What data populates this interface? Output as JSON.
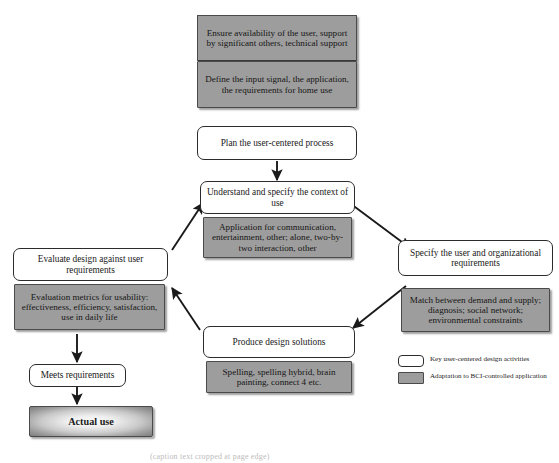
{
  "diagram": {
    "colors": {
      "white_box_fill": "#ffffff",
      "gray_box_fill": "#9d9d9d",
      "outline": "#2b2b2b",
      "arrow": "#1a1a1a",
      "actual_use_center": "#fbfbfb",
      "actual_use_edge": "#7d7d7d"
    },
    "top_stack": [
      {
        "id": "ensure-availability",
        "type": "adaptation",
        "text": "Ensure availability of the user, support by significant others, technical support"
      },
      {
        "id": "define-input-signal",
        "type": "adaptation",
        "text": "Define the input signal, the application, the requirements for home use"
      },
      {
        "id": "plan-process",
        "type": "key-activity",
        "text": "Plan the user-centered process"
      }
    ],
    "cycle": [
      {
        "id": "understand-context",
        "type": "key-activity",
        "text": "Understand and specify the context of use",
        "adaptation": "Application for communication, entertainment, other; alone, two-by-two interaction, other"
      },
      {
        "id": "specify-requirements",
        "type": "key-activity",
        "text": "Specify the user and organizational requirements",
        "adaptation": "Match between demand and supply; diagnosis; social network; environmental constraints"
      },
      {
        "id": "produce-design-solutions",
        "type": "key-activity",
        "text": "Produce design solutions",
        "adaptation": "Spelling, spelling hybrid, brain painting, connect 4 etc."
      },
      {
        "id": "evaluate-design",
        "type": "key-activity",
        "text": "Evaluate design against user requirements",
        "adaptation": "Evaluation metrics for usability: effectiveness, efficiency, satisfaction, use in daily life"
      }
    ],
    "outcome_chain": [
      {
        "id": "meets-requirements",
        "type": "key-activity",
        "text": "Meets requirements"
      },
      {
        "id": "actual-use",
        "type": "outcome",
        "text": "Actual use"
      }
    ],
    "legend": [
      {
        "swatch": "white",
        "text": "Key user-centered design activities"
      },
      {
        "swatch": "gray",
        "text": "Adaptation to BCI-controlled application"
      }
    ],
    "caption_sliver": "(caption text cropped at page edge)"
  }
}
